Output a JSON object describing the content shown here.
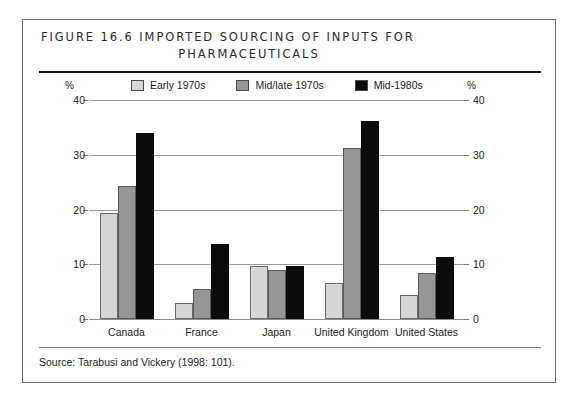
{
  "figure": {
    "title_line_1": "FIGURE 16.6  IMPORTED SOURCING OF INPUTS FOR",
    "title_line_2": "PHARMACEUTICALS",
    "source": "Source:  Tarabusi and Vickery (1998: 101)."
  },
  "axis": {
    "unit_caption_left": "%",
    "unit_caption_right": "%"
  },
  "chart_data": {
    "type": "bar",
    "title": "FIGURE 16.6  IMPORTED SOURCING OF INPUTS FOR PHARMACEUTICALS",
    "xlabel": "",
    "ylabel": "%",
    "ylim": [
      0,
      40
    ],
    "yticks": [
      0,
      10,
      20,
      30,
      40
    ],
    "ytick_labels": [
      "0",
      "10",
      "20",
      "30",
      "40"
    ],
    "grid": true,
    "legend_position": "top",
    "categories": [
      "Canada",
      "France",
      "Japan",
      "United Kingdom",
      "United States"
    ],
    "series": [
      {
        "name": "Early 1970s",
        "color": "#d6d6d6",
        "values": [
          19.3,
          3.0,
          9.6,
          6.5,
          4.3
        ]
      },
      {
        "name": "Mid/late 1970s",
        "color": "#969696",
        "values": [
          24.3,
          5.4,
          9.0,
          31.3,
          8.4
        ]
      },
      {
        "name": "Mid-1980s",
        "color": "#0b0b0b",
        "values": [
          34.0,
          13.7,
          9.7,
          36.2,
          11.4
        ]
      }
    ],
    "source": "Source:  Tarabusi and Vickery (1998: 101)."
  }
}
